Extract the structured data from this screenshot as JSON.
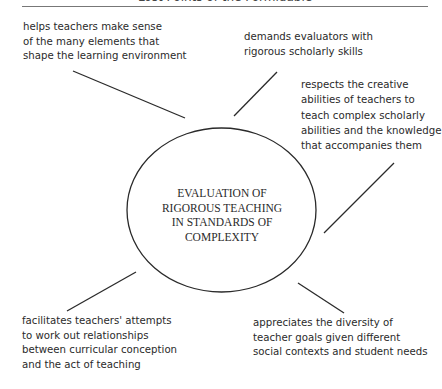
{
  "header": {
    "title": "Lost Points of the Formidable"
  },
  "diagram": {
    "center": {
      "text": "EVALUATION OF\nRIGOROUS TEACHING\nIN STANDARDS OF\nCOMPLEXITY"
    },
    "nodes": [
      {
        "id": "top-left",
        "text": "helps teachers make sense\nof the many elements that\nshape the learning environment"
      },
      {
        "id": "top-right",
        "text": "demands evaluators with\nrigorous scholarly skills"
      },
      {
        "id": "right",
        "text": "respects the creative\nabilities of teachers to\nteach complex scholarly\nabilities and the knowledge\nthat accompanies them"
      },
      {
        "id": "bottom-left",
        "text": "facilitates teachers' attempts\nto work out relationships\nbetween curricular conception\nand the act of teaching"
      },
      {
        "id": "bottom-right",
        "text": "appreciates the diversity of\nteacher goals given different\nsocial contexts and student needs"
      }
    ],
    "colors": {
      "line": "#2a2a2a",
      "text": "#2a2a2a",
      "background": "#ffffff"
    }
  }
}
